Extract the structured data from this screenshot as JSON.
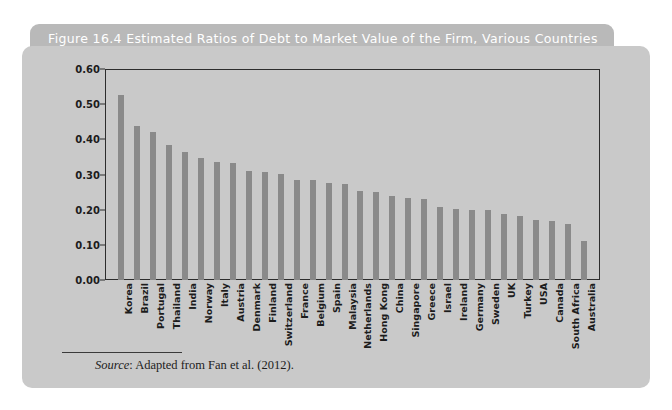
{
  "figure": {
    "title": "Figure 16.4  Estimated Ratios of Debt to Market Value of the Firm, Various Countries",
    "source_label": "Source",
    "source_text": ": Adapted from Fan et al. (2012)."
  },
  "colors": {
    "page_background": "#ffffff",
    "title_bar": "#b9b9b9",
    "title_text": "#ffffff",
    "panel_background": "#c9c9c9",
    "bar_fill": "#8a8a8a",
    "axis_line": "#2d2d2d",
    "text": "#1c1c1c"
  },
  "chart_data": {
    "type": "bar",
    "title": "Figure 16.4  Estimated Ratios of Debt to Market Value of the Firm, Various Countries",
    "xlabel": "",
    "ylabel": "",
    "ylim": [
      0.0,
      0.6
    ],
    "yticks": [
      "0.00",
      "0.10",
      "0.20",
      "0.30",
      "0.40",
      "0.50",
      "0.60"
    ],
    "ytick_values": [
      0.0,
      0.1,
      0.2,
      0.3,
      0.4,
      0.5,
      0.6
    ],
    "grid": false,
    "legend": "none",
    "categories": [
      "Korea",
      "Brazil",
      "Portugal",
      "Thailand",
      "India",
      "Norway",
      "Italy",
      "Austria",
      "Denmark",
      "Finland",
      "Switzerland",
      "France",
      "Belgium",
      "Spain",
      "Malaysia",
      "Netherlands",
      "Hong Kong",
      "China",
      "Singapore",
      "Greece",
      "Israel",
      "Ireland",
      "Germany",
      "Sweden",
      "UK",
      "Turkey",
      "USA",
      "Canada",
      "South Africa",
      "Australia"
    ],
    "values": [
      0.525,
      0.437,
      0.421,
      0.385,
      0.363,
      0.347,
      0.336,
      0.334,
      0.311,
      0.306,
      0.302,
      0.285,
      0.283,
      0.277,
      0.272,
      0.252,
      0.25,
      0.24,
      0.233,
      0.229,
      0.209,
      0.203,
      0.2,
      0.198,
      0.188,
      0.183,
      0.17,
      0.168,
      0.16,
      0.112
    ]
  }
}
